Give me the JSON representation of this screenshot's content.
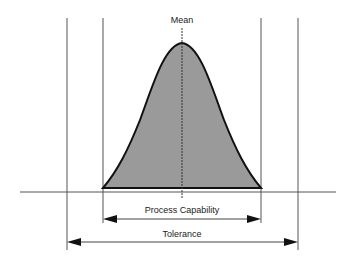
{
  "diagram": {
    "labels": {
      "mean": "Mean",
      "process_capability": "Process Capability",
      "tolerance": "Tolerance"
    },
    "colors": {
      "curve_fill": "#9a9a9a",
      "lines": "#333333"
    }
  }
}
